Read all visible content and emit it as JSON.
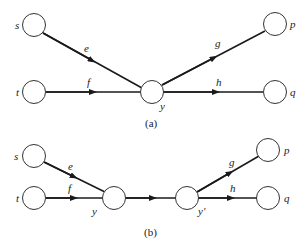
{
  "colors": {
    "line": "#1a1a1a",
    "node_stroke": "#333333",
    "background": "#ffffff"
  },
  "panels": [
    {
      "caption": "(a)",
      "nodes": [
        {
          "id": "s",
          "label": "s",
          "x": 34,
          "y": 25
        },
        {
          "id": "t",
          "label": "t",
          "x": 34,
          "y": 92
        },
        {
          "id": "y",
          "label": "y",
          "x": 152,
          "y": 92
        },
        {
          "id": "p",
          "label": "p",
          "x": 275,
          "y": 24
        },
        {
          "id": "q",
          "label": "q",
          "x": 275,
          "y": 92
        }
      ],
      "edges": [
        {
          "label": "e",
          "from": "s",
          "to": "y"
        },
        {
          "label": "f",
          "from": "t",
          "to": "y"
        },
        {
          "label": "g",
          "from": "y",
          "to": "p"
        },
        {
          "label": "h",
          "from": "y",
          "to": "q"
        }
      ]
    },
    {
      "caption": "(b)",
      "nodes": [
        {
          "id": "s",
          "label": "s",
          "x": 34,
          "y": 156
        },
        {
          "id": "t",
          "label": "t",
          "x": 34,
          "y": 198
        },
        {
          "id": "y",
          "label": "y",
          "x": 114,
          "y": 198
        },
        {
          "id": "y'",
          "label": "y'",
          "x": 187,
          "y": 198
        },
        {
          "id": "p",
          "label": "p",
          "x": 268,
          "y": 150
        },
        {
          "id": "q",
          "label": "q",
          "x": 268,
          "y": 198
        }
      ],
      "edges": [
        {
          "label": "e",
          "from": "s",
          "to": "y"
        },
        {
          "label": "f",
          "from": "t",
          "to": "y"
        },
        {
          "label": "",
          "from": "y",
          "to": "y'"
        },
        {
          "label": "g",
          "from": "y'",
          "to": "p"
        },
        {
          "label": "h",
          "from": "y'",
          "to": "q"
        }
      ]
    }
  ]
}
